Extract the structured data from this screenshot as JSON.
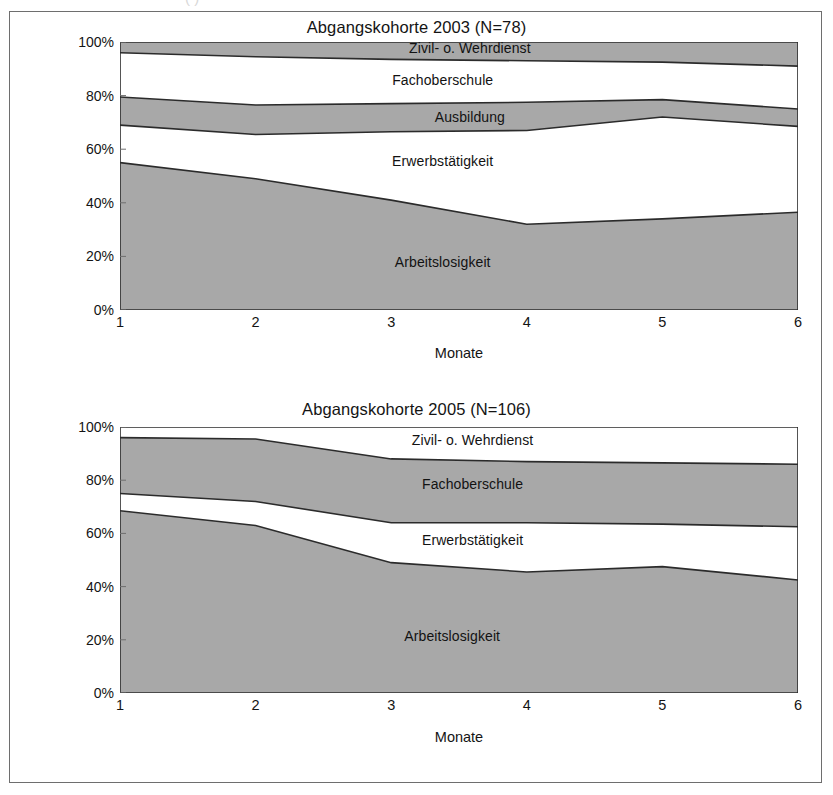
{
  "page": {
    "top_artifact_text": "(      )"
  },
  "charts": [
    {
      "id": "chart-2003",
      "title": "Abgangskohorte 2003 (N=78)",
      "xlabel": "Monate",
      "ylabel": "",
      "yticks": [
        "100%",
        "80%",
        "60%",
        "40%",
        "20%",
        "0%"
      ],
      "xticks": [
        "1",
        "2",
        "3",
        "4",
        "5",
        "6"
      ],
      "band_labels": [
        {
          "text": "Zivil- o. Wehrdienst",
          "x": 3.58,
          "y": 97.6
        },
        {
          "text": "Fachoberschule",
          "x": 3.38,
          "y": 86.0
        },
        {
          "text": "Ausbildung",
          "x": 3.58,
          "y": 72.0
        },
        {
          "text": "Erwerbstätigkeit",
          "x": 3.38,
          "y": 55.5
        },
        {
          "text": "Arbeitslosigkeit",
          "x": 3.38,
          "y": 18.0
        }
      ]
    },
    {
      "id": "chart-2005",
      "title": "Abgangskohorte 2005 (N=106)",
      "xlabel": "Monate",
      "ylabel": "",
      "yticks": [
        "100%",
        "80%",
        "60%",
        "40%",
        "20%",
        "0%"
      ],
      "xticks": [
        "1",
        "2",
        "3",
        "4",
        "5",
        "6"
      ],
      "band_labels": [
        {
          "text": "Zivil- o. Wehrdienst",
          "x": 3.6,
          "y": 95.0
        },
        {
          "text": "Fachoberschule",
          "x": 3.6,
          "y": 78.5
        },
        {
          "text": "Erwerbstätigkeit",
          "x": 3.6,
          "y": 57.5
        },
        {
          "text": "Arbeitslosigkeit",
          "x": 3.45,
          "y": 21.5
        }
      ]
    }
  ],
  "chart_data": [
    {
      "type": "area",
      "title": "Abgangskohorte 2003 (N=78)",
      "subtitle": "",
      "xlabel": "Monate",
      "ylabel": "",
      "x": [
        1,
        2,
        3,
        4,
        5,
        6
      ],
      "xlim": [
        1,
        6
      ],
      "ylim": [
        0,
        100
      ],
      "yticks": [
        0,
        20,
        40,
        60,
        80,
        100
      ],
      "ytick_labels": [
        "0%",
        "20%",
        "40%",
        "60%",
        "80%",
        "100%"
      ],
      "stacked": true,
      "grid": false,
      "legend": "inline-band-labels",
      "series": [
        {
          "name": "Arbeitslosigkeit",
          "fill": "#a8a8a8",
          "values": [
            55.0,
            49.0,
            41.0,
            32.0,
            34.0,
            36.5
          ]
        },
        {
          "name": "Erwerbstätigkeit",
          "fill": "#ffffff",
          "values": [
            14.0,
            16.5,
            25.5,
            35.0,
            38.0,
            32.0
          ]
        },
        {
          "name": "Ausbildung",
          "fill": "#a8a8a8",
          "values": [
            10.5,
            11.0,
            10.5,
            10.5,
            6.5,
            6.5
          ]
        },
        {
          "name": "Fachoberschule",
          "fill": "#ffffff",
          "values": [
            16.5,
            18.0,
            16.5,
            15.5,
            14.0,
            16.0
          ]
        },
        {
          "name": "Zivil- o. Wehrdienst",
          "fill": "#a8a8a8",
          "values": [
            4.0,
            5.5,
            6.5,
            7.0,
            7.5,
            9.0
          ]
        }
      ],
      "cumulative_tops": {
        "Arbeitslosigkeit": [
          55.0,
          49.0,
          41.0,
          32.0,
          34.0,
          36.5
        ],
        "Erwerbstätigkeit": [
          69.0,
          65.5,
          66.5,
          67.0,
          72.0,
          68.5
        ],
        "Ausbildung": [
          79.5,
          76.5,
          77.0,
          77.5,
          78.5,
          75.0
        ],
        "Fachoberschule": [
          96.0,
          94.5,
          93.5,
          93.0,
          92.5,
          91.0
        ],
        "Zivil- o. Wehrdienst": [
          100,
          100,
          100,
          100,
          100,
          100
        ]
      }
    },
    {
      "type": "area",
      "title": "Abgangskohorte 2005 (N=106)",
      "subtitle": "",
      "xlabel": "Monate",
      "ylabel": "",
      "x": [
        1,
        2,
        3,
        4,
        5,
        6
      ],
      "xlim": [
        1,
        6
      ],
      "ylim": [
        0,
        100
      ],
      "yticks": [
        0,
        20,
        40,
        60,
        80,
        100
      ],
      "ytick_labels": [
        "0%",
        "20%",
        "40%",
        "60%",
        "80%",
        "100%"
      ],
      "stacked": true,
      "grid": false,
      "legend": "inline-band-labels",
      "series": [
        {
          "name": "Arbeitslosigkeit",
          "fill": "#a8a8a8",
          "values": [
            68.5,
            63.0,
            49.0,
            45.5,
            47.5,
            42.5
          ]
        },
        {
          "name": "Erwerbstätigkeit",
          "fill": "#ffffff",
          "values": [
            6.5,
            9.0,
            15.0,
            18.5,
            16.0,
            20.0
          ]
        },
        {
          "name": "Fachoberschule",
          "fill": "#a8a8a8",
          "values": [
            21.0,
            23.5,
            24.0,
            23.0,
            23.0,
            23.5
          ]
        },
        {
          "name": "Zivil- o. Wehrdienst",
          "fill": "#ffffff",
          "values": [
            4.0,
            4.5,
            12.0,
            13.0,
            13.5,
            14.0
          ]
        }
      ],
      "cumulative_tops": {
        "Arbeitslosigkeit": [
          68.5,
          63.0,
          49.0,
          45.5,
          47.5,
          42.5
        ],
        "Erwerbstätigkeit": [
          75.0,
          72.0,
          64.0,
          64.0,
          63.5,
          62.5
        ],
        "Fachoberschule": [
          96.0,
          95.5,
          88.0,
          87.0,
          86.5,
          86.0
        ],
        "Zivil- o. Wehrdienst": [
          100,
          100,
          100,
          100,
          100,
          100
        ]
      }
    }
  ],
  "colors": {
    "band_gray": "#a8a8a8",
    "band_white": "#ffffff",
    "outline": "#2b2b2b",
    "frame": "#6e6e6e",
    "text": "#141414"
  }
}
